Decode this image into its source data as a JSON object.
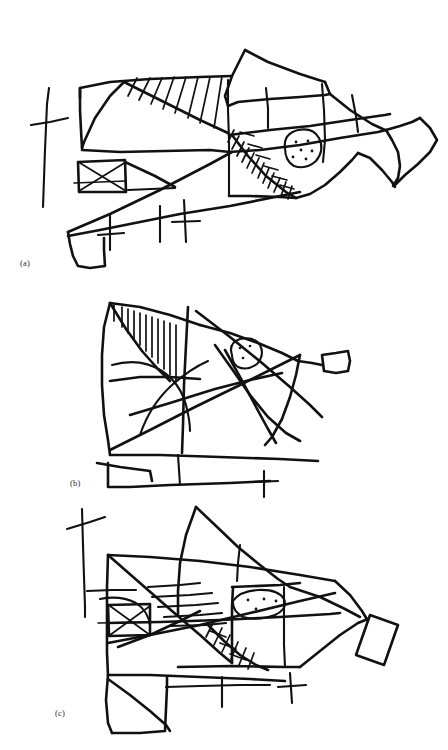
{
  "document": {
    "background_color": "#ffffff",
    "ink_color": "#111111",
    "figure_type": "hand-drawn line sketches",
    "panel_count": 3
  },
  "captions": {
    "a": "(a)",
    "b": "(b)",
    "c": "(c)"
  },
  "panels": [
    {
      "id": "a",
      "caption": "(a)",
      "description": "Hand-drawn fish-like sketch with hatched dorsal band, stippled oval eye region, cross-hatched diagonal gill band, boxed X motif at left, and a forked tail at right",
      "motifs": [
        "vertical-tick-mark",
        "hatched-band",
        "boxed-x",
        "stipple-oval",
        "cross-hatch-band",
        "forked-tail"
      ],
      "stipple_dot_count": 6
    },
    {
      "id": "b",
      "caption": "(b)",
      "description": "Hand-drawn angular sketch with vertical comb hatching at upper left, small stippled oval with two dots, crossing diagonal lines, and a small flag shape at the right",
      "motifs": [
        "comb-hatching",
        "stipple-oval",
        "crossing-diagonals",
        "flag-tail",
        "baseline-tick"
      ],
      "stipple_dot_count": 3
    },
    {
      "id": "c",
      "caption": "(c)",
      "description": "Hand-drawn fish-like sketch with parallel horizontal strokes, stippled oval, ladder cross-hatch band, boxed X motif, long cross tick at upper left and a rotated quadrilateral tail",
      "motifs": [
        "cross-tick",
        "parallel-strokes",
        "stipple-oval",
        "ladder-hatching",
        "boxed-x",
        "quad-tail"
      ],
      "stipple_dot_count": 4
    }
  ]
}
